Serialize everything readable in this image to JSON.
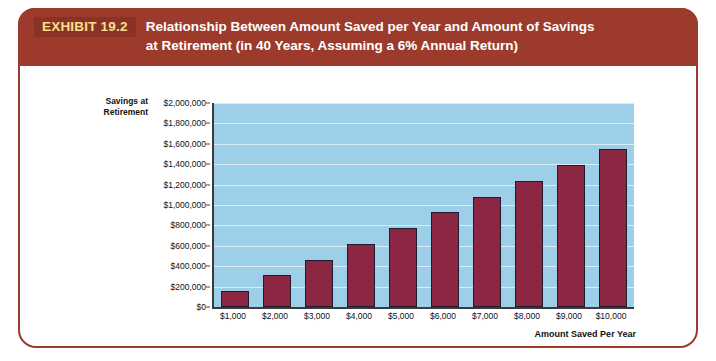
{
  "header": {
    "tag": "EXHIBIT 19.2",
    "title_line1": "Relationship Between Amount Saved per Year and Amount of Savings",
    "title_line2": "at Retirement (in 40 Years, Assuming a 6% Annual Return)"
  },
  "colors": {
    "header_band": "#9c3b2c",
    "tag_box": "#8a3225",
    "tag_text": "#f6e08a",
    "card_border": "#9c3b2c",
    "plot_background": "#9ecfe8",
    "gridline": "#d9ecf7",
    "bar_fill": "#8b2743",
    "bar_border": "#1d1c2e",
    "axis_line": "#3a3a3a"
  },
  "chart_data": {
    "type": "bar",
    "title": "Relationship Between Amount Saved per Year and Amount of Savings at Retirement (in 40 Years, Assuming a 6% Annual Return)",
    "xlabel": "Amount Saved Per Year",
    "ylabel": "Savings at Retirement",
    "ylabel_line1": "Savings at",
    "ylabel_line2": "Retirement",
    "categories": [
      "$1,000",
      "$2,000",
      "$3,000",
      "$4,000",
      "$5,000",
      "$6,000",
      "$7,000",
      "$8,000",
      "$9,000",
      "$10,000"
    ],
    "values": [
      154762,
      309524,
      464286,
      619048,
      773810,
      928571,
      1083333,
      1238095,
      1392857,
      1547619
    ],
    "ylim": [
      0,
      2000000
    ],
    "ytick_values": [
      0,
      200000,
      400000,
      600000,
      800000,
      1000000,
      1200000,
      1400000,
      1600000,
      1800000,
      2000000
    ],
    "ytick_labels": [
      "$0",
      "$200,000",
      "$400,000",
      "$600,000",
      "$800,000",
      "$1,000,000",
      "$1,200,000",
      "$1,400,000",
      "$1,600,000",
      "$1,800,000",
      "$2,000,000"
    ],
    "grid": true,
    "legend": false
  }
}
